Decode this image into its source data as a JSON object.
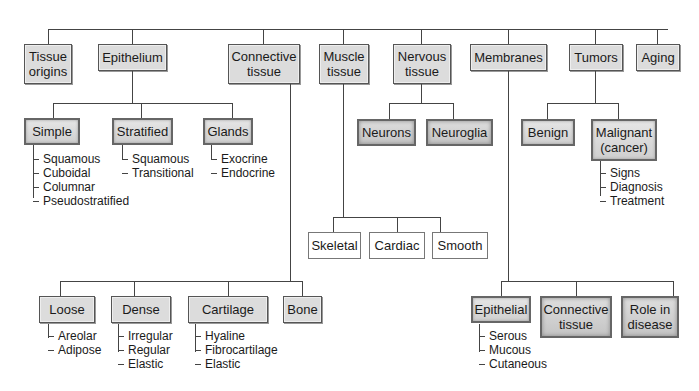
{
  "top_level": [
    {
      "label": "Tissue\norigins"
    },
    {
      "label": "Epithelium"
    },
    {
      "label": "Connective\ntissue"
    },
    {
      "label": "Muscle\ntissue"
    },
    {
      "label": "Nervous\ntissue"
    },
    {
      "label": "Membranes"
    },
    {
      "label": "Tumors"
    },
    {
      "label": "Aging"
    }
  ],
  "epithelium": {
    "children": [
      {
        "label": "Simple",
        "items": [
          "Squamous",
          "Cuboidal",
          "Columnar",
          "Pseudostratified"
        ]
      },
      {
        "label": "Stratified",
        "items": [
          "Squamous",
          "Transitional"
        ]
      },
      {
        "label": "Glands",
        "items": [
          "Exocrine",
          "Endocrine"
        ]
      }
    ]
  },
  "connective": {
    "children": [
      {
        "label": "Loose",
        "items": [
          "Areolar",
          "Adipose"
        ]
      },
      {
        "label": "Dense",
        "items": [
          "Irregular",
          "Regular",
          "Elastic"
        ]
      },
      {
        "label": "Cartilage",
        "items": [
          "Hyaline",
          "Fibrocartilage",
          "Elastic"
        ]
      },
      {
        "label": "Bone",
        "items": []
      }
    ]
  },
  "muscle": {
    "children": [
      {
        "label": "Skeletal"
      },
      {
        "label": "Cardiac"
      },
      {
        "label": "Smooth"
      }
    ]
  },
  "nervous": {
    "children": [
      {
        "label": "Neurons"
      },
      {
        "label": "Neuroglia"
      }
    ]
  },
  "membranes": {
    "children": [
      {
        "label": "Epithelial",
        "items": [
          "Serous",
          "Mucous",
          "Cutaneous"
        ]
      },
      {
        "label": "Connective\ntissue",
        "items": []
      },
      {
        "label": "Role in\ndisease",
        "items": []
      }
    ]
  },
  "tumors": {
    "children": [
      {
        "label": "Benign",
        "items": []
      },
      {
        "label": "Malignant\n(cancer)",
        "items": [
          "Signs",
          "Diagnosis",
          "Treatment"
        ]
      }
    ]
  }
}
